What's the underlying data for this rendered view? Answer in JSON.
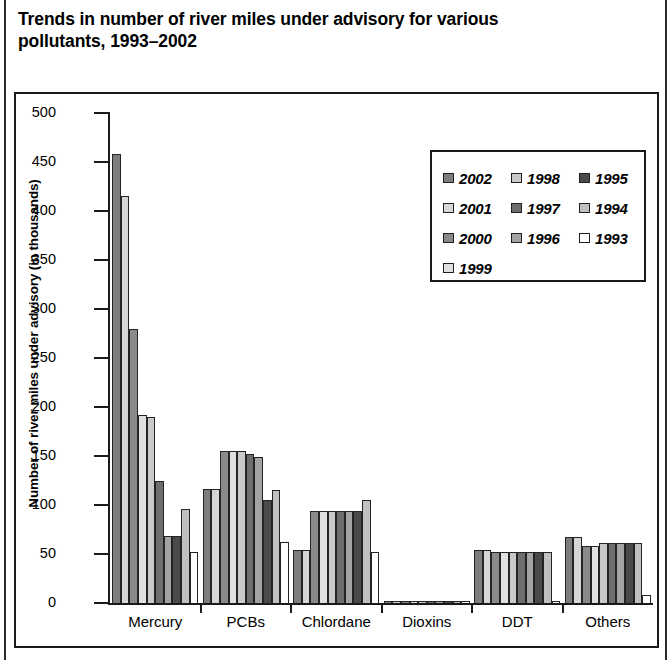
{
  "title": "Trends in number of river miles under advisory for various pollutants, 1993–2002",
  "chart_data": {
    "type": "bar",
    "title": "Trends in number of river miles under advisory for various pollutants, 1993–2002",
    "xlabel": "",
    "ylabel": "Number of river miles under advisory (in thousands)",
    "ylim": [
      0,
      500
    ],
    "yticks": [
      0,
      50,
      100,
      150,
      200,
      250,
      300,
      350,
      400,
      450,
      500
    ],
    "ytick_labels": [
      "0",
      "50",
      "100",
      "150",
      "200",
      "250",
      "300",
      "350",
      "400",
      "450",
      "500"
    ],
    "grid": false,
    "legend_position": "upper right",
    "categories": [
      "Mercury",
      "PCBs",
      "Chlordane",
      "Dioxins",
      "DDT",
      "Others"
    ],
    "series": [
      {
        "name": "2002",
        "color": "#7d7d7d",
        "values": [
          458,
          116,
          54,
          2,
          54,
          67
        ]
      },
      {
        "name": "2001",
        "color": "#d6d6d6",
        "values": [
          415,
          116,
          54,
          2,
          54,
          67
        ]
      },
      {
        "name": "2000",
        "color": "#8a8a8a",
        "values": [
          280,
          155,
          94,
          2,
          52,
          58
        ]
      },
      {
        "name": "1999",
        "color": "#e0e0e0",
        "values": [
          192,
          155,
          94,
          2,
          52,
          58
        ]
      },
      {
        "name": "1998",
        "color": "#c9c9c9",
        "values": [
          190,
          155,
          94,
          2,
          52,
          61
        ]
      },
      {
        "name": "1997",
        "color": "#6e6e6e",
        "values": [
          125,
          152,
          94,
          2,
          52,
          61
        ]
      },
      {
        "name": "1996",
        "color": "#a3a3a3",
        "values": [
          68,
          149,
          94,
          2,
          52,
          61
        ]
      },
      {
        "name": "1995",
        "color": "#4a4a4a",
        "values": [
          68,
          105,
          94,
          2,
          52,
          61
        ]
      },
      {
        "name": "1994",
        "color": "#c0c0c0",
        "values": [
          96,
          115,
          105,
          2,
          52,
          61
        ]
      },
      {
        "name": "1993",
        "color": "#ffffff",
        "values": [
          52,
          62,
          52,
          2,
          2,
          8
        ]
      }
    ]
  },
  "legend": {
    "items": [
      {
        "label": "2002",
        "color": "#7d7d7d"
      },
      {
        "label": "1998",
        "color": "#c9c9c9"
      },
      {
        "label": "1995",
        "color": "#4a4a4a"
      },
      {
        "label": "2001",
        "color": "#d6d6d6"
      },
      {
        "label": "1997",
        "color": "#6e6e6e"
      },
      {
        "label": "1994",
        "color": "#c0c0c0"
      },
      {
        "label": "2000",
        "color": "#8a8a8a"
      },
      {
        "label": "1996",
        "color": "#a3a3a3"
      },
      {
        "label": "1993",
        "color": "#ffffff"
      },
      {
        "label": "1999",
        "color": "#e0e0e0"
      }
    ]
  }
}
